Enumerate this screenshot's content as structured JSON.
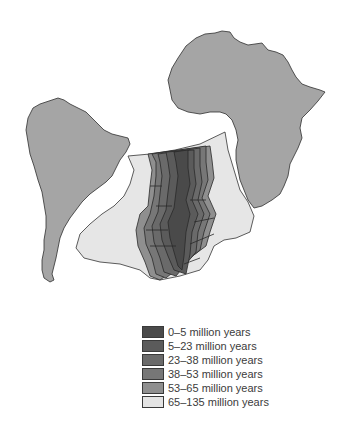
{
  "figure": {
    "type": "seafloor-age-map",
    "landmasses": [
      {
        "name": "South America",
        "color": "#a5a5a5"
      },
      {
        "name": "Africa",
        "color": "#a5a5a5"
      }
    ],
    "ocean_floor_background": "#e6e6e6",
    "outline_color": "#333333"
  },
  "legend": {
    "items": [
      {
        "label": "0–5 million years",
        "color": "#4a4a4a"
      },
      {
        "label": "5–23 million years",
        "color": "#5b5b5b"
      },
      {
        "label": "23–38 million years",
        "color": "#6a6a6a"
      },
      {
        "label": "38–53 million years",
        "color": "#777777"
      },
      {
        "label": "53–65 million years",
        "color": "#8f8f8f"
      },
      {
        "label": "65–135 million years",
        "color": "#e4e4e4"
      }
    ]
  }
}
